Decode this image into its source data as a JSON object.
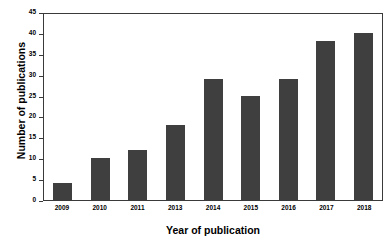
{
  "chart_data": {
    "type": "bar",
    "title": "",
    "xlabel": "Year of publication",
    "ylabel": "Number of publications",
    "categories": [
      "2009",
      "2010",
      "2011",
      "2013",
      "2014",
      "2015",
      "2016",
      "2017",
      "2018"
    ],
    "values": [
      4,
      10,
      12,
      18,
      29,
      25,
      29,
      38,
      40
    ],
    "ylim": [
      0,
      45
    ],
    "ytick_values": [
      0,
      5,
      10,
      15,
      20,
      25,
      30,
      35,
      40,
      45
    ],
    "ytick_labels": [
      "0",
      "5",
      "10",
      "15",
      "20",
      "25",
      "30",
      "35",
      "40",
      "45"
    ],
    "grid": false,
    "legend": false,
    "bar_color": "#3f3f3f",
    "background_color": "#ffffff",
    "axis_color": "#3a3a3a"
  }
}
